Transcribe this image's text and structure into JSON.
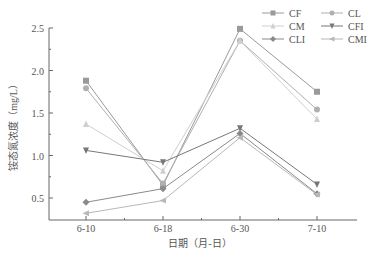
{
  "chart_data": {
    "type": "line",
    "title": "",
    "xlabel": "日期（月-日）",
    "ylabel": "铵态氮浓度（mg/L）",
    "categories": [
      "6-10",
      "6-18",
      "6-30",
      "7-10"
    ],
    "ylim": [
      0.25,
      2.5
    ],
    "yticks": [
      0.5,
      1.0,
      1.5,
      2.0,
      2.5
    ],
    "ytick_labels": [
      "0.5",
      "1.0",
      "1.5",
      "2.0",
      "2.5"
    ],
    "grid": false,
    "legend_position": "top-right",
    "series": [
      {
        "name": "CF",
        "marker": "square",
        "color": "#9a9a9a",
        "values": [
          1.88,
          0.65,
          2.49,
          1.75
        ]
      },
      {
        "name": "CL",
        "marker": "circle",
        "color": "#b0b0b0",
        "values": [
          1.79,
          0.67,
          2.35,
          1.54
        ]
      },
      {
        "name": "CM",
        "marker": "triangle-up",
        "color": "#cfcfcf",
        "values": [
          1.37,
          0.82,
          2.35,
          1.43
        ]
      },
      {
        "name": "CFI",
        "marker": "triangle-down",
        "color": "#777777",
        "values": [
          1.06,
          0.92,
          1.32,
          0.66
        ]
      },
      {
        "name": "CLI",
        "marker": "diamond",
        "color": "#8a8a8a",
        "values": [
          0.45,
          0.61,
          1.26,
          0.55
        ]
      },
      {
        "name": "CMI",
        "marker": "triangle-left",
        "color": "#b8b8b8",
        "values": [
          0.32,
          0.47,
          1.21,
          0.54
        ]
      }
    ]
  }
}
